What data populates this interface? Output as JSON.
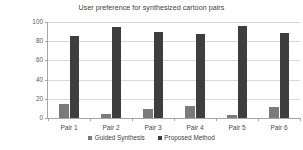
{
  "chart_data": {
    "type": "bar",
    "title": "User preference for synthesized cartoon pairs",
    "xlabel": "",
    "ylabel": "Percentage of the votes(%)",
    "categories": [
      "Pair 1",
      "Pair 2",
      "Pair 3",
      "Pair 4",
      "Pair 5",
      "Pair 6"
    ],
    "series": [
      {
        "name": "Guided Synthesis",
        "color": "#7b7b7b",
        "values": [
          15,
          4,
          9,
          12,
          3,
          11
        ]
      },
      {
        "name": "Proposed Method",
        "color": "#3e3e3e",
        "values": [
          85,
          95,
          90,
          88,
          96,
          89
        ]
      }
    ],
    "ylim": [
      0,
      100
    ],
    "yticks": [
      0,
      20,
      40,
      60,
      80,
      100
    ],
    "ytick_labels": [
      "0",
      "20",
      "40",
      "60",
      "80",
      "100"
    ],
    "grid": true,
    "grid_axis": "y",
    "legend_position": "bottom-center",
    "orientation": "vertical"
  }
}
